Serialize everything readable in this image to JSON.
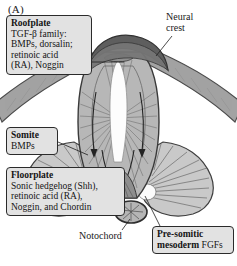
{
  "figure": {
    "panel_label": "(A)"
  },
  "callouts": {
    "roofplate": {
      "title": "Roofplate",
      "lines": [
        "TGF-β family:",
        "BMPs, dorsalin;",
        "retinoic acid",
        "(RA), Noggin"
      ]
    },
    "somite": {
      "title": "Somite",
      "lines": [
        "BMPs"
      ]
    },
    "floorplate": {
      "title": "Floorplate",
      "lines": [
        "Sonic hedgehog (Shh),",
        "retinoic acid (RA),",
        "Noggin, and Chordin"
      ]
    },
    "presomitic": {
      "title": "Pre-somitic",
      "lines": [
        "mesoderm FGFs"
      ]
    }
  },
  "labels": {
    "neural_crest": [
      "Neural",
      "crest"
    ],
    "notochord": "Notochord"
  },
  "colors": {
    "ink": "#1a1a1a",
    "box_fill": "#e2e2e2",
    "box_border": "#2b2b2b",
    "ectoderm": "#9a9a9a",
    "neural_crest": "#5a5a5a",
    "tube_wall": "#b4b4b4",
    "floorplate": "#8a8a8a",
    "lumen": "#fdfdfd",
    "somite": "#c6c6c6",
    "notochord": "#b0b0b0"
  }
}
